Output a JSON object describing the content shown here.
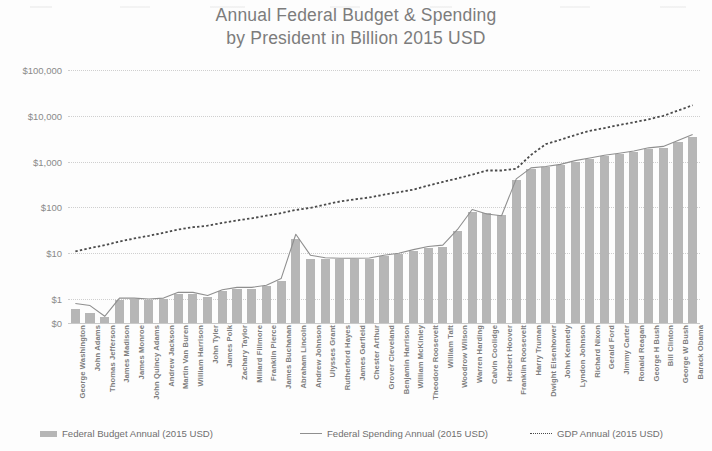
{
  "title": {
    "line1": "Annual Federal Budget & Spending",
    "line2": "by President in Billion 2015 USD"
  },
  "legend": {
    "budget": "Federal Budget Annual (2015 USD)",
    "spending": "Federal Spending Annual (2015 USD)",
    "gdp": "GDP Annual (2015 USD)"
  },
  "colors": {
    "bar": "#b6b6b6",
    "spending_line": "#8f8f8f",
    "gdp_line": "#4a4a4a",
    "grid": "#cfcfcf",
    "text": "#7c7c7c"
  },
  "chart_data": {
    "type": "bar",
    "title": "Annual Federal Budget & Spending by President in Billion 2015 USD",
    "xlabel": "",
    "ylabel": "",
    "yscale": "log",
    "ylim": [
      0.3,
      100000
    ],
    "ytick_labels": [
      "$100,000",
      "$10,000",
      "$1,000",
      "$100",
      "$10",
      "$1",
      "$0"
    ],
    "ytick_values": [
      100000,
      10000,
      1000,
      100,
      10,
      1,
      0.3
    ],
    "grid": true,
    "legend_position": "bottom",
    "categories": [
      "George Washington",
      "John Adams",
      "Thomas Jefferson",
      "James Madison",
      "James Monroe",
      "John Quincy Adams",
      "Andrew Jackson",
      "Martin Van Buren",
      "William Harrison",
      "John Tyler",
      "James Polk",
      "Zachary Taylor",
      "Millard Fillmore",
      "Franklin Pierce",
      "James Buchanan",
      "Abraham Lincoln",
      "Andrew Johnson",
      "Ulysses Grant",
      "Rutherford Hayes",
      "James Garfield",
      "Chester Arthur",
      "Grover Cleveland",
      "Benjamin Harrison",
      "William McKinley",
      "Theodore Roosevelt",
      "William Taft",
      "Woodrow Wilson",
      "Warren Harding",
      "Calvin Coolidge",
      "Herbert Hoover",
      "Franklin Roosevelt",
      "Harry Truman",
      "Dwight Eisenhower",
      "John Kennedy",
      "Lyndon Johnson",
      "Richard Nixon",
      "Gerald Ford",
      "Jimmy Carter",
      "Ronald Reagan",
      "George H Bush",
      "Bill Clinton",
      "George W Bush",
      "Barack Obama"
    ],
    "series": [
      {
        "name": "Federal Budget Annual (2015 USD)",
        "type": "bar",
        "values": [
          0.62,
          0.5,
          0.4,
          0.95,
          1.0,
          0.95,
          1.0,
          1.3,
          1.3,
          1.1,
          1.5,
          1.7,
          1.7,
          1.9,
          2.5,
          20,
          7.5,
          7.5,
          7.5,
          7.5,
          7.5,
          8.5,
          9.5,
          11,
          13,
          14,
          30,
          80,
          75,
          70,
          400,
          700,
          750,
          830,
          1000,
          1150,
          1300,
          1450,
          1600,
          1900,
          2000,
          2700,
          3500
        ]
      },
      {
        "name": "Federal Spending Annual (2015 USD)",
        "type": "line",
        "values": [
          0.8,
          0.72,
          0.42,
          1.05,
          1.05,
          1.0,
          1.05,
          1.4,
          1.4,
          1.2,
          1.6,
          1.8,
          1.8,
          2.0,
          2.8,
          26,
          9.0,
          8.0,
          7.8,
          7.8,
          7.9,
          9.0,
          10,
          12,
          14,
          15,
          33,
          90,
          72,
          66,
          420,
          730,
          780,
          870,
          1050,
          1200,
          1380,
          1520,
          1700,
          2000,
          2150,
          2900,
          3900
        ]
      },
      {
        "name": "GDP Annual (2015 USD)",
        "type": "line",
        "values": [
          11,
          13,
          15,
          18,
          21,
          24,
          28,
          33,
          37,
          40,
          46,
          52,
          58,
          66,
          75,
          88,
          98,
          115,
          135,
          150,
          165,
          190,
          215,
          245,
          300,
          360,
          430,
          520,
          640,
          640,
          700,
          1400,
          2400,
          3000,
          3800,
          4700,
          5400,
          6300,
          7200,
          8400,
          10000,
          13000,
          17000
        ]
      }
    ]
  }
}
